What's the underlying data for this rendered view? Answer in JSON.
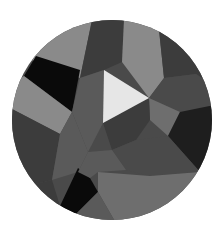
{
  "logo": {
    "name": "Low-poly grayscale play-button emblem",
    "shape": "circle",
    "center": [
      112,
      120
    ],
    "radius": 100,
    "icon": "play-icon",
    "colors": {
      "background": "#ffffff",
      "play": "#e6e6e6",
      "black": "#0a0a0a",
      "darkest": "#1e1e1e",
      "dark": "#3c3c3c",
      "mid_dark": "#4a4a4a",
      "mid": "#5a5a5a",
      "mid_light": "#6e6e6e",
      "light": "#8a8a8a",
      "lighter": "#9e9e9e"
    }
  }
}
